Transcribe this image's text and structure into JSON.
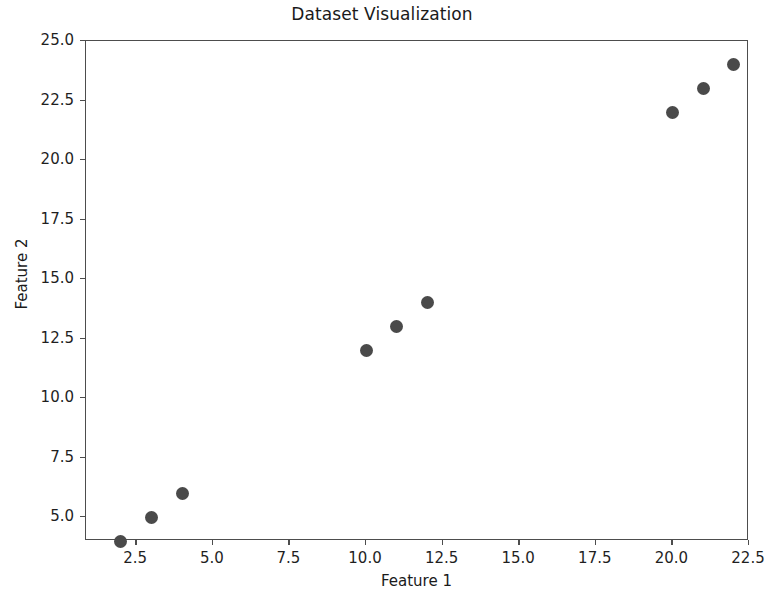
{
  "chart_data": {
    "type": "scatter",
    "title": "Dataset Visualization",
    "xlabel": "Feature 1",
    "ylabel": "Feature 2",
    "x": [
      2,
      3,
      4,
      10,
      11,
      12,
      20,
      21,
      22
    ],
    "y": [
      4,
      5,
      6,
      12,
      13,
      14,
      22,
      23,
      24
    ],
    "points": [
      {
        "x": 2,
        "y": 4
      },
      {
        "x": 3,
        "y": 5
      },
      {
        "x": 4,
        "y": 6
      },
      {
        "x": 10,
        "y": 12
      },
      {
        "x": 11,
        "y": 13
      },
      {
        "x": 12,
        "y": 14
      },
      {
        "x": 20,
        "y": 22
      },
      {
        "x": 21,
        "y": 23
      },
      {
        "x": 22,
        "y": 24
      }
    ],
    "xlim": [
      0.86,
      22.5
    ],
    "ylim": [
      4.0,
      25.0
    ],
    "xticks": [
      2.5,
      5.0,
      7.5,
      10.0,
      12.5,
      15.0,
      17.5,
      20.0,
      22.5
    ],
    "yticks": [
      5.0,
      7.5,
      10.0,
      12.5,
      15.0,
      17.5,
      20.0,
      22.5,
      25.0
    ],
    "xtick_labels": [
      "2.5",
      "5.0",
      "7.5",
      "10.0",
      "12.5",
      "15.0",
      "17.5",
      "20.0",
      "22.5"
    ],
    "ytick_labels": [
      "5.0",
      "7.5",
      "10.0",
      "12.5",
      "15.0",
      "17.5",
      "20.0",
      "22.5",
      "25.0"
    ],
    "grid": false,
    "legend": null,
    "marker_color": "#4a4a4a",
    "marker_size": 13,
    "axes_color": "#4d4d4d",
    "background_color": "#ffffff"
  }
}
